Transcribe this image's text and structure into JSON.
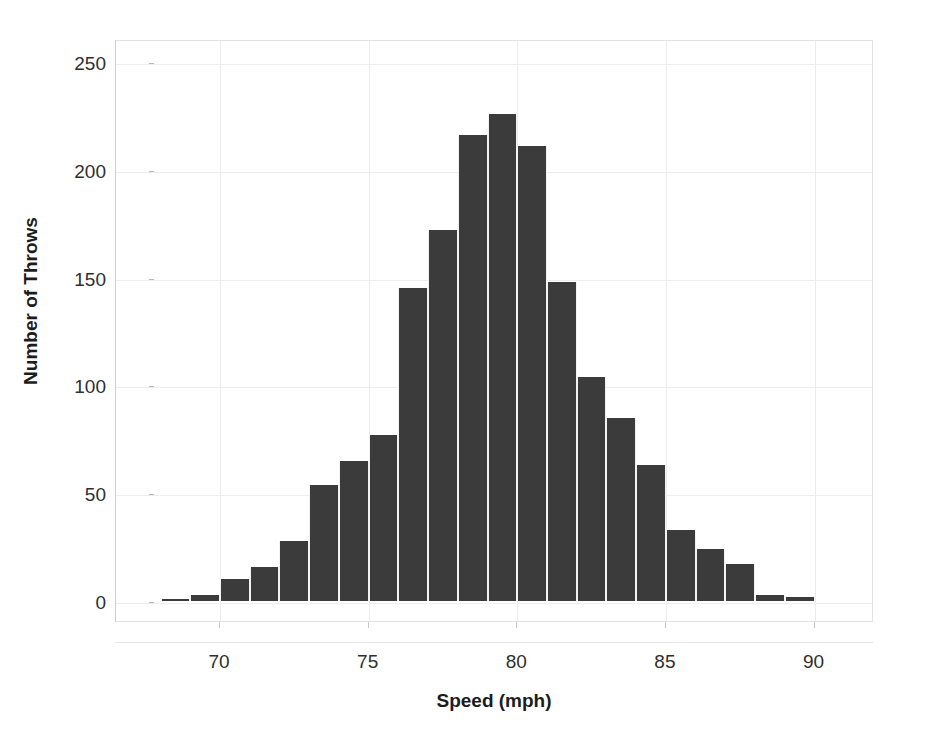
{
  "chart_data": {
    "type": "bar",
    "title": "",
    "subtitle": "",
    "xlabel": "Speed (mph)",
    "ylabel": "Number of Throws",
    "xlim": [
      66.5,
      92
    ],
    "ylim": [
      0,
      262
    ],
    "grid": true,
    "legend": null,
    "bar_color": "#3b3b3b",
    "bin_width": 1,
    "xticks": [
      70,
      75,
      80,
      85,
      90
    ],
    "yticks": [
      0,
      50,
      100,
      150,
      200,
      250
    ],
    "categories": [
      68,
      69,
      70,
      71,
      72,
      73,
      74,
      75,
      76,
      77,
      78,
      79,
      80,
      81,
      82,
      83,
      84,
      85,
      86,
      87,
      88,
      89
    ],
    "bin_labels": [
      "68-69",
      "69-70",
      "70-71",
      "71-72",
      "72-73",
      "73-74",
      "74-75",
      "75-76",
      "76-77",
      "77-78",
      "78-79",
      "79-80",
      "80-81",
      "81-82",
      "82-83",
      "83-84",
      "84-85",
      "85-86",
      "86-87",
      "87-88",
      "88-89",
      "89-90"
    ],
    "values": [
      1,
      3,
      10,
      16,
      28,
      54,
      65,
      77,
      145,
      172,
      216,
      226,
      211,
      148,
      104,
      85,
      63,
      33,
      24,
      17,
      3,
      2
    ]
  },
  "axes": {
    "y_tick_labels": [
      "0",
      "50",
      "100",
      "150",
      "200",
      "250"
    ],
    "x_tick_labels": [
      "70",
      "75",
      "80",
      "85",
      "90"
    ],
    "x_title": "Speed (mph)",
    "y_title": "Number of Throws"
  },
  "colors": {
    "bar": "#3b3b3b",
    "grid": "#ededed",
    "axis": "#cfcfcf",
    "text": "#1c1c1c",
    "background": "#ffffff"
  }
}
